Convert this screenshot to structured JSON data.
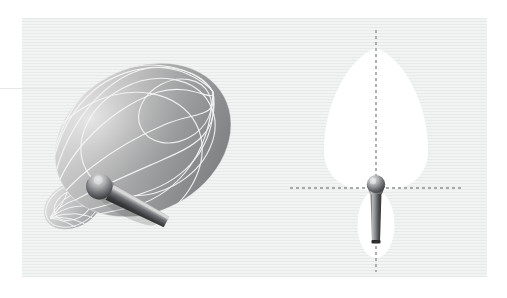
{
  "figure": {
    "kind": "microphone-polar-pattern-illustration",
    "panel": {
      "background_color": "#eceded",
      "stripe_color": "#e8eaea",
      "x": 22,
      "y": 18,
      "width": 465,
      "height": 259
    },
    "page_background": "#ffffff"
  },
  "left_panel": {
    "name": "three-dimensional-polar-pattern",
    "description": "3D rendered supercardioid pickup pattern surface with wireframe meridians and a microphone passing through it",
    "surface": {
      "fill_light": "#d8d8d8",
      "fill_mid": "#a9a9a9",
      "fill_dark": "#7f8081",
      "wireframe_color": "#f4f4f4",
      "main_lobe_center_x": 143,
      "main_lobe_center_y": 140,
      "main_lobe_radius_x": 92,
      "main_lobe_radius_y": 72,
      "main_lobe_rotation_deg": -28,
      "rear_lobe_center_x": 73,
      "rear_lobe_center_y": 205,
      "rear_lobe_radius_x": 31,
      "rear_lobe_radius_y": 22,
      "meridian_count": 8,
      "parallel_count": 3,
      "pole_front_x": 213,
      "pole_front_y": 92,
      "pole_rear_x": 50,
      "pole_rear_y": 218
    },
    "microphone": {
      "name": "microphone-3d",
      "capsule_color_light": "#cfcfcf",
      "capsule_color_dark": "#58595b",
      "body_color_light": "#b8b8b8",
      "body_color_dark": "#404042",
      "capsule_x": 110,
      "capsule_y": 192,
      "angle_deg": 28
    }
  },
  "right_panel": {
    "name": "two-dimensional-polar-pattern",
    "description": "2D cross-section of the supercardioid pickup pattern with vertical and horizontal dashed axes through the microphone capsule",
    "lobe": {
      "fill_color": "#ffffff",
      "front_lobe_tip_y": 48,
      "front_lobe_max_width": 104,
      "front_lobe_widest_y": 150,
      "rear_lobe_bottom_y": 258,
      "rear_lobe_max_width": 38
    },
    "axes": {
      "color": "#8e8f90",
      "dash_pattern": "3 3",
      "vertical_x": 376,
      "vertical_top_y": 30,
      "vertical_bottom_y": 272,
      "horizontal_y": 188,
      "horizontal_left_x": 290,
      "horizontal_right_x": 462
    },
    "microphone": {
      "name": "microphone-2d",
      "capsule_color_light": "#d6d6d6",
      "capsule_color_dark": "#56575a",
      "body_color_light": "#b0b0b0",
      "body_color_dark": "#3a3b3d",
      "capsule_center_x": 376,
      "capsule_center_y": 185,
      "capsule_radius": 9,
      "body_bottom_y": 243
    }
  }
}
